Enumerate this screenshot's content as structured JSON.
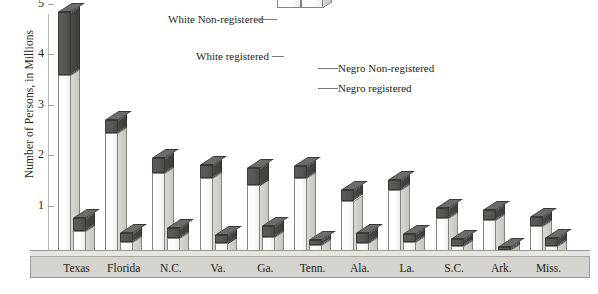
{
  "chart": {
    "type": "bar",
    "ylabel": "Number of Persons, in Millions",
    "yticks": [
      "1",
      "2",
      "3",
      "4",
      "5"
    ],
    "ylim": [
      0,
      5
    ],
    "grid": false
  },
  "legend": {
    "position": "top-center",
    "items": [
      {
        "label": "White Non-registered",
        "color": "#585653",
        "anchor": "left"
      },
      {
        "label": "White registered",
        "color": "#fdfdfc",
        "anchor": "left"
      },
      {
        "label": "Negro Non-registered",
        "color": "#585653",
        "anchor": "right"
      },
      {
        "label": "Negro registered",
        "color": "#fdfdfc",
        "anchor": "right"
      }
    ]
  },
  "chart_data": {
    "type": "bar",
    "title": "",
    "subtitle": "",
    "xlabel": "",
    "ylabel": "Number of Persons, in Millions",
    "ylim": [
      0,
      5
    ],
    "yticks": [
      1,
      2,
      3,
      4,
      5
    ],
    "grid": false,
    "legend_position": "top-center",
    "style": "stacked grouped 3-D columns; two columns per state (White, Negro); each column stacked registered (light) + non-registered (dark)",
    "categories": [
      "Texas",
      "Florida",
      "N.C.",
      "Va.",
      "Ga.",
      "Tenn.",
      "Ala.",
      "La.",
      "S.C.",
      "Ark.",
      "Miss."
    ],
    "series": [
      {
        "name": "White registered",
        "color": "#fdfdfc",
        "values": [
          3.6,
          2.45,
          1.65,
          1.55,
          1.4,
          1.55,
          1.1,
          1.3,
          0.75,
          0.72,
          0.6
        ]
      },
      {
        "name": "White Non-registered",
        "color": "#585653",
        "values": [
          1.25,
          0.25,
          0.3,
          0.25,
          0.35,
          0.23,
          0.2,
          0.2,
          0.2,
          0.2,
          0.18
        ]
      },
      {
        "name": "Negro registered",
        "color": "#fdfdfc",
        "values": [
          0.5,
          0.28,
          0.35,
          0.25,
          0.38,
          0.22,
          0.25,
          0.28,
          0.2,
          0.12,
          0.2
        ]
      },
      {
        "name": "Negro Non-registered",
        "color": "#585653",
        "values": [
          0.25,
          0.17,
          0.2,
          0.17,
          0.22,
          0.1,
          0.2,
          0.15,
          0.13,
          0.06,
          0.15
        ]
      }
    ],
    "totals": {
      "white": [
        4.85,
        2.7,
        1.95,
        1.8,
        1.75,
        1.78,
        1.3,
        1.5,
        0.95,
        0.92,
        0.78
      ],
      "negro": [
        0.75,
        0.45,
        0.55,
        0.42,
        0.6,
        0.32,
        0.45,
        0.43,
        0.33,
        0.18,
        0.35
      ]
    }
  },
  "xlabels": [
    "Texas",
    "Florida",
    "N.C.",
    "Va.",
    "Ga.",
    "Tenn.",
    "Ala.",
    "La.",
    "S.C.",
    "Ark.",
    "Miss."
  ]
}
